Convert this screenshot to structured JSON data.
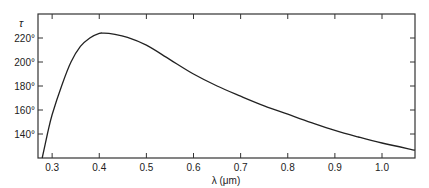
{
  "chart_data": {
    "type": "line",
    "title": "",
    "xlabel": "λ (μm)",
    "ylabel": "τ",
    "xlim": [
      0.27,
      1.07
    ],
    "ylim": [
      120,
      240
    ],
    "xticks": [
      0.3,
      0.4,
      0.5,
      0.6,
      0.7,
      0.8,
      0.9,
      1.0
    ],
    "xtick_labels": [
      "0.3",
      "0.4",
      "0.5",
      "0.6",
      "0.7",
      "0.8",
      "0.9",
      "1.0"
    ],
    "yticks": [
      140,
      160,
      180,
      200,
      220
    ],
    "ytick_labels": [
      "140°",
      "160°",
      "180°",
      "200°",
      "220°"
    ],
    "grid": false,
    "legend": null,
    "series": [
      {
        "name": "τ(λ)",
        "x": [
          0.279,
          0.29,
          0.3,
          0.32,
          0.34,
          0.36,
          0.38,
          0.4,
          0.41,
          0.43,
          0.46,
          0.5,
          0.55,
          0.6,
          0.65,
          0.7,
          0.75,
          0.8,
          0.85,
          0.9,
          0.95,
          1.0,
          1.07
        ],
        "y": [
          120,
          140,
          156,
          180,
          200,
          213,
          220,
          223.8,
          224,
          223.2,
          220.5,
          214,
          202,
          190,
          180,
          171.5,
          163.5,
          156.5,
          149.5,
          143,
          137.5,
          132.5,
          126.5
        ]
      }
    ]
  }
}
